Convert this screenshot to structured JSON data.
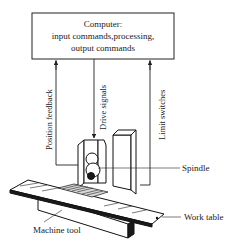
{
  "computer_box": {
    "title": "Computer:",
    "line2": "input commands,processing,",
    "line3": "output commands"
  },
  "signals": {
    "position_feedback": "Position feedback",
    "drive_signals": "Drive signals",
    "limit_switches": "Limit switches"
  },
  "callouts": {
    "spindle": "Spindle",
    "work_table": "Work table",
    "machine_tool": "Machine tool"
  }
}
